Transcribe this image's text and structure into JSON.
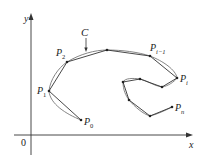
{
  "figure": {
    "axes": {
      "x_label": "x",
      "y_label": "y",
      "origin_label": "0"
    },
    "curve_label": "C",
    "points": [
      {
        "name": "P0",
        "label": "P",
        "sub": "0",
        "x": 81,
        "y": 120
      },
      {
        "name": "P1",
        "label": "P",
        "sub": "1",
        "x": 49,
        "y": 91
      },
      {
        "name": "P2",
        "label": "P",
        "sub": "2",
        "x": 67,
        "y": 62
      },
      {
        "name": "Pi-1",
        "label": "P",
        "sub": "i−1",
        "x": 150,
        "y": 56
      },
      {
        "name": "Pi",
        "label": "P",
        "sub": "i",
        "x": 177,
        "y": 78
      },
      {
        "name": "Pn",
        "label": "P",
        "sub": "n",
        "x": 172,
        "y": 107
      }
    ],
    "colors": {
      "curve": "#777777",
      "polygon": "#333333",
      "axis": "#333333",
      "point": "#222222"
    }
  }
}
